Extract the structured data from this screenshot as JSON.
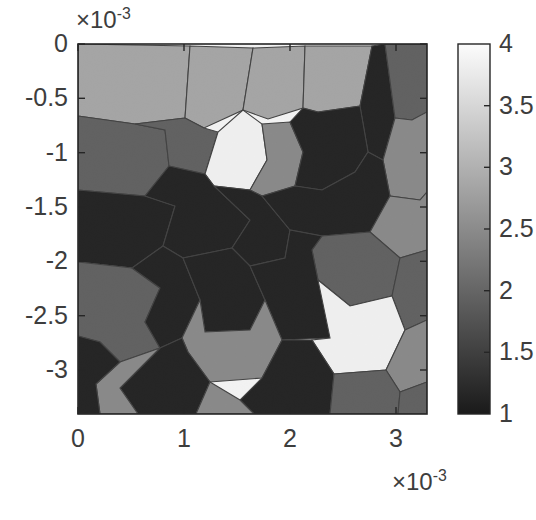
{
  "figure": {
    "type": "voronoi-grain-map",
    "background": "#ffffff",
    "plot_box": {
      "x": 78,
      "y": 44,
      "width": 349,
      "height": 370
    },
    "axis_line_color": "#262626",
    "cell_edge_color": "#3c3c3c"
  },
  "chart_data": {
    "type": "heatmap",
    "title": "",
    "xlabel": "",
    "ylabel": "",
    "x_exponent_label": "×10",
    "x_exponent_power": "-3",
    "y_exponent_label": "×10",
    "y_exponent_power": "-3",
    "xlim": [
      0,
      3.3
    ],
    "ylim": [
      -3.3,
      0
    ],
    "x_ticks": [
      "0",
      "1",
      "2",
      "3"
    ],
    "x_tick_values": [
      0,
      1,
      2,
      3
    ],
    "y_ticks": [
      "0",
      "-0.5",
      "-1",
      "-1.5",
      "-2",
      "-2.5",
      "-3"
    ],
    "y_tick_values": [
      0,
      -0.5,
      -1,
      -1.5,
      -2,
      -2.5,
      -3
    ],
    "grid": false,
    "legend": "colorbar-right",
    "colorbar": {
      "min": 1,
      "max": 4,
      "ticks": [
        "4",
        "3.5",
        "3",
        "2.5",
        "2",
        "1.5",
        "1"
      ],
      "tick_values": [
        4,
        3.5,
        3,
        2.5,
        2,
        1.5,
        1
      ],
      "colormap": "gray",
      "low_color": "#1a1a1a",
      "high_color": "#fcfcfc",
      "box": {
        "x": 458,
        "y": 44,
        "width": 32,
        "height": 370
      }
    },
    "value_levels": [
      {
        "value": 1.0,
        "color": "#1b1b1b",
        "label": "level-1"
      },
      {
        "value": 2.0,
        "color": "#5e5e5e",
        "label": "level-2"
      },
      {
        "value": 2.6,
        "color": "#8a8a8a",
        "label": "level-3"
      },
      {
        "value": 3.0,
        "color": "#a9a9a9",
        "label": "level-4"
      },
      {
        "value": 4.0,
        "color": "#fbfbfb",
        "label": "level-5"
      }
    ],
    "cells": [
      {
        "id": "c01",
        "value": 3.0,
        "color": "#a9a9a9",
        "points": "78,44 78,116 135,124 185,118 190,46"
      },
      {
        "id": "c02",
        "value": 3.0,
        "color": "#a9a9a9",
        "points": "190,46 185,118 204,128 243,110 253,48"
      },
      {
        "id": "c03",
        "value": 3.0,
        "color": "#a9a9a9",
        "points": "253,48 243,110 268,119 303,108 305,46"
      },
      {
        "id": "c04",
        "value": 3.0,
        "color": "#a9a9a9",
        "points": "305,46 303,108 318,112 360,106 372,46"
      },
      {
        "id": "c05",
        "value": 1.0,
        "color": "#1b1b1b",
        "points": "372,46 360,106 368,152 383,160 395,118 385,44"
      },
      {
        "id": "c06",
        "value": 2.0,
        "color": "#5e5e5e",
        "points": "385,44 395,118 412,120 427,112 427,44"
      },
      {
        "id": "c07",
        "value": 2.0,
        "color": "#5e5e5e",
        "points": "78,116 78,190 145,196 169,166 165,130 135,124"
      },
      {
        "id": "c08",
        "value": 2.0,
        "color": "#5e5e5e",
        "points": "135,124 165,130 169,166 205,174 218,132 204,128 185,118"
      },
      {
        "id": "c09",
        "value": 4.0,
        "color": "#fbfbfb",
        "points": "218,132 205,174 214,186 250,190 267,160 262,124 243,110"
      },
      {
        "id": "c10",
        "value": 2.6,
        "color": "#8a8a8a",
        "points": "262,124 267,160 250,190 262,196 295,186 303,152 290,122"
      },
      {
        "id": "c11",
        "value": 1.0,
        "color": "#1b1b1b",
        "points": "303,108 290,122 303,152 295,186 322,190 355,172 368,152 360,106 318,112"
      },
      {
        "id": "c12",
        "value": 2.6,
        "color": "#8a8a8a",
        "points": "395,118 383,160 390,196 420,200 427,192 427,112 412,120"
      },
      {
        "id": "c13",
        "value": 1.0,
        "color": "#1b1b1b",
        "points": "78,190 78,262 132,268 163,246 175,206 145,196"
      },
      {
        "id": "c14",
        "value": 1.0,
        "color": "#1b1b1b",
        "points": "145,196 175,206 163,246 183,258 232,248 250,220 214,186 205,174 169,166"
      },
      {
        "id": "c15",
        "value": 1.0,
        "color": "#1b1b1b",
        "points": "250,190 262,196 290,230 285,258 250,266 232,248 250,220 214,186"
      },
      {
        "id": "c16",
        "value": 1.0,
        "color": "#1b1b1b",
        "points": "295,186 322,190 355,172 368,152 383,160 390,196 370,232 322,236 290,230 262,196"
      },
      {
        "id": "c17",
        "value": 2.6,
        "color": "#8a8a8a",
        "points": "390,196 420,200 427,192 427,250 400,258 370,232"
      },
      {
        "id": "c18",
        "value": 4.0,
        "color": "#fbfbfb",
        "points": "78,262 78,336 100,342 145,322 160,288 132,268"
      },
      {
        "id": "c19",
        "value": 2.0,
        "color": "#5e5e5e",
        "points": "132,268 160,288 145,322 160,348 120,362 100,342 78,336 78,262"
      },
      {
        "id": "c20",
        "value": 1.0,
        "color": "#1b1b1b",
        "points": "163,246 183,258 200,300 182,338 160,348 145,322 160,288 132,268"
      },
      {
        "id": "c21",
        "value": 1.0,
        "color": "#1b1b1b",
        "points": "232,248 250,266 265,300 250,330 205,332 200,300 183,258"
      },
      {
        "id": "c22",
        "value": 2.0,
        "color": "#5e5e5e",
        "points": "322,236 370,232 400,258 392,296 350,306 318,280 312,250"
      },
      {
        "id": "c23",
        "value": 2.0,
        "color": "#5e5e5e",
        "points": "400,258 427,250 427,320 405,330 392,296"
      },
      {
        "id": "c24",
        "value": 1.0,
        "color": "#1b1b1b",
        "points": "250,266 285,258 290,230 322,236 312,250 318,280 350,306 330,338 282,340 265,300"
      },
      {
        "id": "c25",
        "value": 4.0,
        "color": "#fbfbfb",
        "points": "318,280 350,306 392,296 405,330 386,370 334,374 312,340 330,338"
      },
      {
        "id": "c26",
        "value": 2.6,
        "color": "#8a8a8a",
        "points": "405,330 427,320 427,382 400,392 386,370"
      },
      {
        "id": "c27",
        "value": 2.6,
        "color": "#8a8a8a",
        "points": "200,300 205,332 250,330 265,300 282,340 262,378 210,382 188,352 182,338"
      },
      {
        "id": "c28",
        "value": 1.0,
        "color": "#1b1b1b",
        "points": "182,338 188,352 210,382 196,414 138,414 120,388 160,348"
      },
      {
        "id": "c29",
        "value": 2.6,
        "color": "#8a8a8a",
        "points": "120,362 160,348 120,388 138,414 100,414 96,384"
      },
      {
        "id": "c30",
        "value": 1.0,
        "color": "#1b1b1b",
        "points": "78,336 100,342 120,362 96,384 100,414 78,414"
      },
      {
        "id": "c31",
        "value": 1.0,
        "color": "#1b1b1b",
        "points": "262,378 282,340 312,340 334,374 330,414 254,414 240,400"
      },
      {
        "id": "c32",
        "value": 2.6,
        "color": "#8a8a8a",
        "points": "210,382 240,400 254,414 196,414"
      },
      {
        "id": "c33",
        "value": 2.0,
        "color": "#5e5e5e",
        "points": "334,374 386,370 400,392 398,414 330,414"
      },
      {
        "id": "c34",
        "value": 2.0,
        "color": "#5e5e5e",
        "points": "400,392 427,382 427,414 398,414"
      }
    ]
  },
  "colorbar_ticks_positions": [
    44,
    105.7,
    167.3,
    229,
    290.7,
    352.3,
    414
  ],
  "x_tick_positions": [
    78,
    184,
    290,
    396
  ],
  "y_tick_positions": [
    44,
    98.3,
    152.7,
    207,
    261.3,
    315.7,
    370
  ]
}
